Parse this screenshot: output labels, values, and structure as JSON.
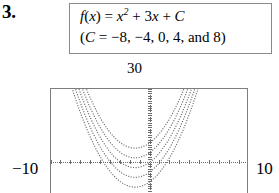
{
  "problem": {
    "number": "3."
  },
  "formula": {
    "line1": {
      "fn": "f",
      "open": "(",
      "var": "x",
      "close": ")",
      "equals": " = ",
      "term1_base": "x",
      "term1_exp": "2",
      "plus1": " + 3",
      "term2": "x",
      "plus2": " + ",
      "constant": "C"
    },
    "line2": "(C = −8, −4, 0, 4, and 8)",
    "line2_parts": {
      "open": "(",
      "const": "C",
      "equals": " = ",
      "values": "−8, −4, 0, 4, and 8",
      "close": ")"
    }
  },
  "graph": {
    "ymax_label": "30",
    "xmin_label": "−10",
    "xmax_label": "10",
    "curve_color": "#6a6a6a",
    "axis_color": "#6f6f6f",
    "frame_color": "#7d7d7d"
  },
  "chart_data": {
    "type": "line",
    "title": "",
    "xlabel": "",
    "ylabel": "",
    "xlim": [
      -10,
      10
    ],
    "ylim": [
      -13.5,
      30
    ],
    "grid": false,
    "legend": "none",
    "line_style": "dotted",
    "x_tick_step": 1,
    "y_tick_step": 1,
    "annotations": [
      "30",
      "-10",
      "10"
    ],
    "function_family": "f(x) = x^2 + 3x + C",
    "parameter_name": "C",
    "parameter_values": [
      -8,
      -4,
      0,
      4,
      8
    ],
    "vertex_x": -1.5,
    "series": [
      {
        "name": "C = -8",
        "expression": "x^2 + 3x - 8",
        "vertex": [
          -1.5,
          -10.25
        ],
        "x": [
          -7.0,
          -6.5,
          -6.0,
          -5.5,
          -5.0,
          -4.5,
          -4.0,
          -3.5,
          -3.0,
          -2.5,
          -2.0,
          -1.5,
          -1.0,
          -0.5,
          0.0,
          0.5,
          1.0,
          1.5,
          2.0,
          2.5,
          3.0,
          3.5,
          4.0
        ],
        "values": [
          20.0,
          14.75,
          10.0,
          5.75,
          2.0,
          -1.25,
          -4.0,
          -6.25,
          -8.0,
          -9.25,
          -10.0,
          -10.25,
          -10.0,
          -9.25,
          -8.0,
          -6.25,
          -4.0,
          -1.25,
          2.0,
          5.75,
          10.0,
          14.75,
          20.0
        ]
      },
      {
        "name": "C = -4",
        "expression": "x^2 + 3x - 4",
        "vertex": [
          -1.5,
          -6.25
        ],
        "x": [
          -7.0,
          -6.5,
          -6.0,
          -5.5,
          -5.0,
          -4.5,
          -4.0,
          -3.5,
          -3.0,
          -2.5,
          -2.0,
          -1.5,
          -1.0,
          -0.5,
          0.0,
          0.5,
          1.0,
          1.5,
          2.0,
          2.5,
          3.0,
          3.5,
          4.0
        ],
        "values": [
          24.0,
          18.75,
          14.0,
          9.75,
          6.0,
          2.75,
          0.0,
          -2.25,
          -4.0,
          -5.25,
          -6.0,
          -6.25,
          -6.0,
          -5.25,
          -4.0,
          -2.25,
          0.0,
          2.75,
          6.0,
          9.75,
          14.0,
          18.75,
          24.0
        ]
      },
      {
        "name": "C = 0",
        "expression": "x^2 + 3x",
        "vertex": [
          -1.5,
          -2.25
        ],
        "x": [
          -7.0,
          -6.5,
          -6.0,
          -5.5,
          -5.0,
          -4.5,
          -4.0,
          -3.5,
          -3.0,
          -2.5,
          -2.0,
          -1.5,
          -1.0,
          -0.5,
          0.0,
          0.5,
          1.0,
          1.5,
          2.0,
          2.5,
          3.0,
          3.5,
          4.0
        ],
        "values": [
          28.0,
          22.75,
          18.0,
          13.75,
          10.0,
          6.75,
          4.0,
          1.75,
          0.0,
          -1.25,
          -2.0,
          -2.25,
          -2.0,
          -1.25,
          0.0,
          1.75,
          4.0,
          6.75,
          10.0,
          13.75,
          18.0,
          22.75,
          28.0
        ]
      },
      {
        "name": "C = 4",
        "expression": "x^2 + 3x + 4",
        "vertex": [
          -1.5,
          1.75
        ],
        "x": [
          -6.5,
          -6.0,
          -5.5,
          -5.0,
          -4.5,
          -4.0,
          -3.5,
          -3.0,
          -2.5,
          -2.0,
          -1.5,
          -1.0,
          -0.5,
          0.0,
          0.5,
          1.0,
          1.5,
          2.0,
          2.5,
          3.0,
          3.5
        ],
        "values": [
          26.75,
          22.0,
          17.75,
          14.0,
          10.75,
          8.0,
          5.75,
          4.0,
          2.75,
          2.0,
          1.75,
          2.0,
          2.75,
          4.0,
          5.75,
          8.0,
          10.75,
          14.0,
          17.75,
          22.0,
          26.75
        ]
      },
      {
        "name": "C = 8",
        "expression": "x^2 + 3x + 8",
        "vertex": [
          -1.5,
          5.75
        ],
        "x": [
          -6.5,
          -6.0,
          -5.5,
          -5.0,
          -4.5,
          -4.0,
          -3.5,
          -3.0,
          -2.5,
          -2.0,
          -1.5,
          -1.0,
          -0.5,
          0.0,
          0.5,
          1.0,
          1.5,
          2.0,
          2.5,
          3.0,
          3.5
        ],
        "values": [
          30.75,
          26.0,
          21.75,
          18.0,
          14.75,
          12.0,
          9.75,
          8.0,
          6.75,
          6.0,
          5.75,
          6.0,
          6.75,
          8.0,
          9.75,
          12.0,
          14.75,
          18.0,
          21.75,
          26.0,
          30.75
        ]
      }
    ]
  }
}
